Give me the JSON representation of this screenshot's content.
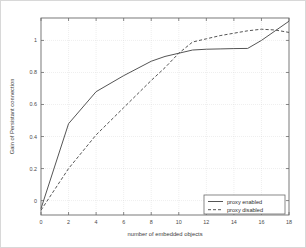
{
  "chart_data": {
    "type": "line",
    "title": "",
    "xlabel": "number of embedded objects",
    "ylabel": "Gain of Persistant connection",
    "xlim": [
      0,
      18
    ],
    "ylim": [
      -0.09,
      1.14
    ],
    "xticks": [
      0,
      2,
      4,
      6,
      8,
      10,
      12,
      14,
      16,
      18
    ],
    "xtick_labels": [
      "0",
      "2",
      "4",
      "6",
      "8",
      "10",
      "12",
      "14",
      "16",
      "18"
    ],
    "yticks": [
      0,
      0.2,
      0.4,
      0.6,
      0.8,
      1
    ],
    "ytick_labels": [
      "0",
      "0.2",
      "0.4",
      "0.6",
      "0.8",
      "1"
    ],
    "grid": true,
    "legend_position": "lower right",
    "series": [
      {
        "name": "proxy enabled",
        "style": "solid",
        "color": "#555555",
        "x": [
          0,
          2,
          4,
          6,
          8,
          9,
          10,
          11,
          12,
          13,
          14,
          15,
          16,
          17,
          18
        ],
        "values": [
          -0.05,
          0.48,
          0.68,
          0.78,
          0.87,
          0.9,
          0.92,
          0.94,
          0.945,
          0.947,
          0.949,
          0.95,
          1.0,
          1.06,
          1.12
        ]
      },
      {
        "name": "proxy disabled",
        "style": "dashed",
        "color": "#555555",
        "x": [
          0,
          2,
          4,
          6,
          8,
          9,
          10,
          11,
          12,
          13,
          14,
          15,
          16,
          17,
          18
        ],
        "values": [
          -0.06,
          0.2,
          0.41,
          0.58,
          0.75,
          0.83,
          0.92,
          0.99,
          1.01,
          1.03,
          1.045,
          1.06,
          1.07,
          1.065,
          1.05
        ]
      }
    ]
  },
  "legend": {
    "entries": [
      {
        "label": "proxy enabled"
      },
      {
        "label": "proxy disabled"
      }
    ]
  },
  "axes": {
    "x_title": "number of embedded objects",
    "y_title": "Gain of Persistant connection"
  }
}
